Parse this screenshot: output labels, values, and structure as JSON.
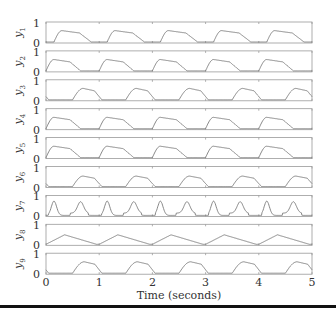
{
  "chart_data": {
    "type": "line",
    "title": "",
    "xlabel": "Time (seconds)",
    "ylabel": "",
    "xlim": [
      0,
      5
    ],
    "ylim": [
      0,
      1
    ],
    "x_ticks": [
      0,
      1,
      2,
      3,
      4,
      5
    ],
    "y_ticks": [
      0,
      1
    ],
    "grid": false,
    "layout": "9 vertically stacked panels sharing x-axis",
    "period_seconds": 1,
    "series": [
      {
        "name": "y1",
        "label_base": "y",
        "label_sub": "1",
        "onset": 0.15,
        "peak_time": 0.3,
        "peak": 0.6,
        "end": 0.85,
        "shape": "rise-plateau-decay"
      },
      {
        "name": "y2",
        "label_base": "y",
        "label_sub": "2",
        "onset": 0.0,
        "peak_time": 0.15,
        "peak": 0.6,
        "end": 0.65,
        "shape": "rise-plateau-decay"
      },
      {
        "name": "y3",
        "label_base": "y",
        "label_sub": "3",
        "onset": 0.5,
        "peak_time": 0.7,
        "peak": 0.6,
        "end": 1.05,
        "shape": "rise-plateau-decay"
      },
      {
        "name": "y4",
        "label_base": "y",
        "label_sub": "4",
        "onset": 0.0,
        "peak_time": 0.15,
        "peak": 0.6,
        "end": 0.65,
        "shape": "rise-plateau-decay"
      },
      {
        "name": "y5",
        "label_base": "y",
        "label_sub": "5",
        "onset": 0.0,
        "peak_time": 0.15,
        "peak": 0.6,
        "end": 0.65,
        "shape": "rise-plateau-decay"
      },
      {
        "name": "y6",
        "label_base": "y",
        "label_sub": "6",
        "onset": 0.5,
        "peak_time": 0.7,
        "peak": 0.55,
        "end": 1.05,
        "shape": "rise-plateau-decay"
      },
      {
        "name": "y7",
        "label_base": "y",
        "label_sub": "7",
        "onset": 0.05,
        "peak_time": 0.15,
        "peak": 0.75,
        "end": 0.4,
        "secondary_peak_time": 0.65,
        "secondary_peak": 0.6,
        "shape": "double-hump"
      },
      {
        "name": "y8",
        "label_base": "y",
        "label_sub": "8",
        "onset": 0.0,
        "peak_time": 0.35,
        "peak": 0.5,
        "end": 0.95,
        "shape": "triangle-slow"
      },
      {
        "name": "y9",
        "label_base": "y",
        "label_sub": "9",
        "onset": 0.5,
        "peak_time": 0.72,
        "peak": 0.6,
        "end": 1.05,
        "shape": "rise-plateau-decay"
      }
    ]
  },
  "axis": {
    "x_tick_labels": [
      "0",
      "1",
      "2",
      "3",
      "4",
      "5"
    ],
    "y_tick_top": "1",
    "y_tick_bottom": "0",
    "xlabel": "Time (seconds)"
  },
  "colors": {
    "line": "#7a7a7a",
    "frame": "#9a9a9a",
    "text": "#333333",
    "rule": "#111111"
  }
}
